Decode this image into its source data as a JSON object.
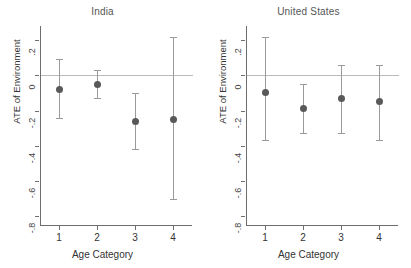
{
  "figure": {
    "ylabel": "ATE of Environment",
    "xlabel": "Age Category",
    "y_ticks": [
      ".2",
      "0",
      "-.2",
      "-.4",
      "-.6",
      "-.8"
    ],
    "x_ticks": [
      "1",
      "2",
      "3",
      "4"
    ],
    "marker_color": "#595959",
    "whisker_color": "#9a9a9a",
    "axis_color": "#6e6e6e",
    "zeroline_color": "#b9b9b9"
  },
  "chart_data": [
    {
      "type": "scatter",
      "title": "India",
      "xlabel": "Age Category",
      "ylabel": "ATE of Environment",
      "categories": [
        "1",
        "2",
        "3",
        "4"
      ],
      "x": [
        1,
        2,
        3,
        4
      ],
      "values": [
        -0.08,
        -0.05,
        -0.26,
        -0.25
      ],
      "ci_low": [
        -0.24,
        -0.13,
        -0.42,
        -0.7
      ],
      "ci_high": [
        0.09,
        0.03,
        -0.1,
        0.22
      ],
      "ylim": [
        -0.85,
        0.28
      ],
      "yticks": [
        0.2,
        0,
        -0.2,
        -0.4,
        -0.6,
        -0.8
      ],
      "ytick_labels": [
        ".2",
        "0",
        "-.2",
        "-.4",
        "-.6",
        "-.8"
      ],
      "grid": false,
      "legend": "none",
      "reference_line": 0
    },
    {
      "type": "scatter",
      "title": "United States",
      "xlabel": "Age Category",
      "ylabel": "ATE of Environment",
      "categories": [
        "1",
        "2",
        "3",
        "4"
      ],
      "x": [
        1,
        2,
        3,
        4
      ],
      "values": [
        -0.1,
        -0.19,
        -0.13,
        -0.15
      ],
      "ci_low": [
        -0.37,
        -0.33,
        -0.33,
        -0.37
      ],
      "ci_high": [
        0.22,
        -0.05,
        0.06,
        0.06
      ],
      "ylim": [
        -0.85,
        0.28
      ],
      "yticks": [
        0.2,
        0,
        -0.2,
        -0.4,
        -0.6,
        -0.8
      ],
      "ytick_labels": [
        ".2",
        "0",
        "-.2",
        "-.4",
        "-.6",
        "-.8"
      ],
      "grid": false,
      "legend": "none",
      "reference_line": 0
    }
  ]
}
